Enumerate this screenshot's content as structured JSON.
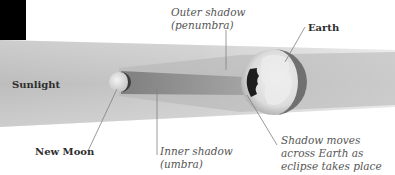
{
  "diagram": {
    "labels": {
      "sunlight": "Sunlight",
      "new_moon": "New Moon",
      "earth": "Earth",
      "outer_shadow_line1": "Outer shadow",
      "outer_shadow_line2": "(penumbra)",
      "inner_shadow_line1": "Inner shadow",
      "inner_shadow_line2": "(umbra)",
      "shadow_moves_line1": "Shadow moves",
      "shadow_moves_line2": "across Earth as",
      "shadow_moves_line3": "eclipse takes place"
    },
    "colors": {
      "background": "#ffffff",
      "corner_block": "#000000",
      "sunlight_beam": "#c9c9c9",
      "penumbra": "#b9b9b9",
      "umbra": "#8e8e8e",
      "earth_land": "#e6e6e6",
      "earth_rim": "#6a6a6a",
      "shadow_on_earth": "#1e1e1e",
      "leader_line": "#777777"
    }
  }
}
